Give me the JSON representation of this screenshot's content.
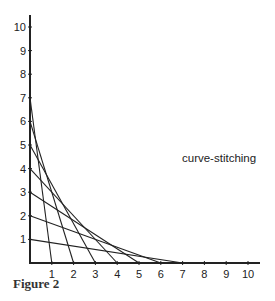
{
  "chart_data": {
    "type": "line",
    "title": "",
    "annotation": "curve-stitching",
    "caption": "Figure 2",
    "xlabel": "",
    "ylabel": "",
    "xlim": [
      0,
      10
    ],
    "ylim": [
      0,
      10
    ],
    "x_ticks": [
      "1",
      "2",
      "3",
      "4",
      "5",
      "6",
      "7",
      "8",
      "9",
      "10"
    ],
    "y_ticks": [
      "1",
      "2",
      "3",
      "4",
      "5",
      "6",
      "7",
      "8",
      "9",
      "10"
    ],
    "grid": false,
    "segments": [
      {
        "from": [
          0,
          7
        ],
        "to": [
          1,
          0
        ]
      },
      {
        "from": [
          0,
          6
        ],
        "to": [
          2,
          0
        ]
      },
      {
        "from": [
          0,
          5
        ],
        "to": [
          3,
          0
        ]
      },
      {
        "from": [
          0,
          4
        ],
        "to": [
          4,
          0
        ]
      },
      {
        "from": [
          0,
          3
        ],
        "to": [
          5,
          0
        ]
      },
      {
        "from": [
          0,
          2
        ],
        "to": [
          6,
          0
        ]
      },
      {
        "from": [
          0,
          1
        ],
        "to": [
          7,
          0
        ]
      }
    ]
  },
  "colors": {
    "ink": "#222222",
    "background": "#ffffff"
  }
}
